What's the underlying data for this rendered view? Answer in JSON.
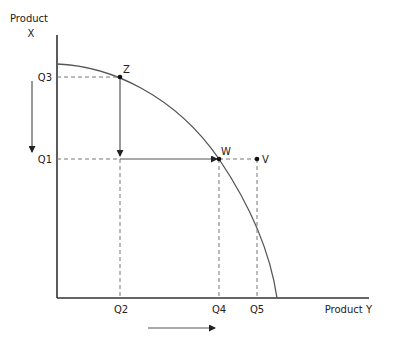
{
  "diagram": {
    "type": "production-possibility-frontier",
    "y_axis": {
      "label_line1": "Product",
      "label_line2": "X"
    },
    "x_axis": {
      "label": "Product Y"
    },
    "y_ticks": [
      {
        "label": "Q3",
        "y": 77
      },
      {
        "label": "Q1",
        "y": 159
      }
    ],
    "x_ticks": [
      {
        "label": "Q2",
        "x": 120
      },
      {
        "label": "Q4",
        "x": 219
      },
      {
        "label": "Q5",
        "x": 257
      }
    ],
    "points": [
      {
        "label": "Z",
        "x": 120,
        "y": 77,
        "on_curve": true
      },
      {
        "label": "W",
        "x": 219,
        "y": 159,
        "on_curve": true
      },
      {
        "label": "V",
        "x": 257,
        "y": 159,
        "on_curve": false
      }
    ],
    "arrows": {
      "left": "decrease in Product X",
      "bottom": "increase in Product Y",
      "path": "Z down to Q1, then right to W"
    },
    "colors": {
      "axis": "#333333",
      "curve": "#555555",
      "guide": "#777777",
      "text": "#222222"
    }
  }
}
